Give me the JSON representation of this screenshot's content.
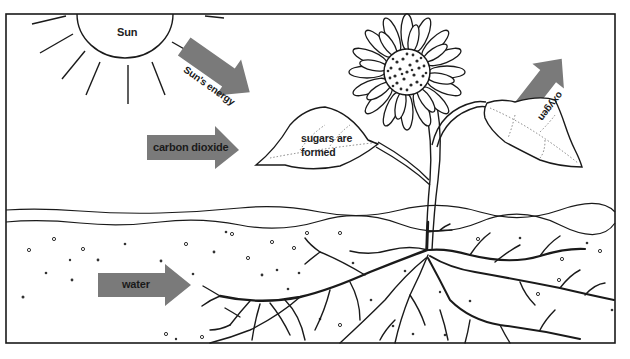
{
  "colors": {
    "line": "#1a1a1a",
    "arrow_fill": "#7a7a7a",
    "background": "#ffffff"
  },
  "labels": {
    "sun": "Sun",
    "suns_energy": "Sun's energy",
    "carbon_dioxide": "carbon dioxide",
    "sugars_line1": "sugars are",
    "sugars_line2": "formed",
    "oxygen": "oxygen",
    "water": "water"
  },
  "arrows": [
    {
      "name": "suns-energy-arrow",
      "label": "Sun's energy",
      "direction": "down-right"
    },
    {
      "name": "carbon-dioxide-arrow",
      "label": "carbon dioxide",
      "direction": "right"
    },
    {
      "name": "oxygen-arrow",
      "label": "oxygen",
      "direction": "up-right"
    },
    {
      "name": "water-arrow",
      "label": "water",
      "direction": "right"
    }
  ]
}
